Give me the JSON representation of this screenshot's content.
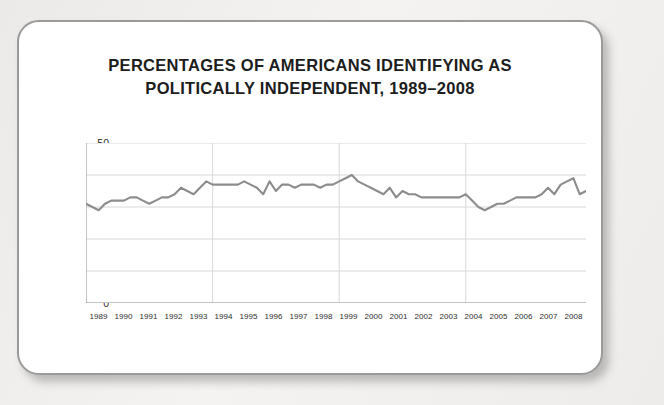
{
  "card": {
    "title_line_1": "PERCENTAGES OF AMERICANS IDENTIFYING AS",
    "title_line_2": "POLITICALLY INDEPENDENT, 1989–2008"
  },
  "colors": {
    "line": "#8c8c8c",
    "grid": "#d8d8d8",
    "axis": "#9c9c9c",
    "card_border": "#9a9a9a",
    "page_background": "#f2f2f0",
    "plot_background": "#ffffff",
    "text": "#1d1d1d"
  },
  "chart_data": {
    "type": "line",
    "title": "PERCENTAGES OF AMERICANS IDENTIFYING AS POLITICALLY INDEPENDENT, 1989–2008",
    "xlabel": "",
    "ylabel": "",
    "ylim": [
      0,
      50
    ],
    "xlim": [
      1989,
      2008.75
    ],
    "yticks": [
      0,
      10,
      20,
      30,
      40,
      50
    ],
    "ytick_labels": [
      "0",
      "10",
      "20",
      "30",
      "40",
      "50"
    ],
    "xtick_labels": [
      "1989",
      "1990",
      "1991",
      "1992",
      "1993",
      "1994",
      "1995",
      "1996",
      "1997",
      "1998",
      "1999",
      "2000",
      "2001",
      "2002",
      "2003",
      "2004",
      "2005",
      "2006",
      "2007",
      "2008"
    ],
    "grid": true,
    "legend": false,
    "series": [
      {
        "name": "Percent identifying as independent",
        "x": [
          1989.0,
          1989.25,
          1989.5,
          1989.75,
          1990.0,
          1990.25,
          1990.5,
          1990.75,
          1991.0,
          1991.25,
          1991.5,
          1991.75,
          1992.0,
          1992.25,
          1992.5,
          1992.75,
          1993.0,
          1993.25,
          1993.5,
          1993.75,
          1994.0,
          1994.25,
          1994.5,
          1994.75,
          1995.0,
          1995.25,
          1995.5,
          1995.75,
          1996.0,
          1996.25,
          1996.5,
          1996.75,
          1997.0,
          1997.25,
          1997.5,
          1997.75,
          1998.0,
          1998.25,
          1998.5,
          1998.75,
          1999.0,
          1999.25,
          1999.5,
          1999.75,
          2000.0,
          2000.25,
          2000.5,
          2000.75,
          2001.0,
          2001.25,
          2001.5,
          2001.75,
          2002.0,
          2002.25,
          2002.5,
          2002.75,
          2003.0,
          2003.25,
          2003.5,
          2003.75,
          2004.0,
          2004.25,
          2004.5,
          2004.75,
          2005.0,
          2005.25,
          2005.5,
          2005.75,
          2006.0,
          2006.25,
          2006.5,
          2006.75,
          2007.0,
          2007.25,
          2007.5,
          2007.75,
          2008.0,
          2008.25,
          2008.5,
          2008.75
        ],
        "values": [
          31,
          30,
          29,
          31,
          32,
          32,
          32,
          33,
          33,
          32,
          31,
          32,
          33,
          33,
          34,
          36,
          35,
          34,
          36,
          38,
          37,
          37,
          37,
          37,
          37,
          38,
          37,
          36,
          34,
          38,
          35,
          37,
          37,
          36,
          37,
          37,
          37,
          36,
          37,
          37,
          38,
          39,
          40,
          38,
          37,
          36,
          35,
          34,
          36,
          33,
          35,
          34,
          34,
          33,
          33,
          33,
          33,
          33,
          33,
          33,
          34,
          32,
          30,
          29,
          30,
          31,
          31,
          32,
          33,
          33,
          33,
          33,
          34,
          36,
          34,
          37,
          38,
          39,
          34,
          35
        ]
      }
    ]
  }
}
